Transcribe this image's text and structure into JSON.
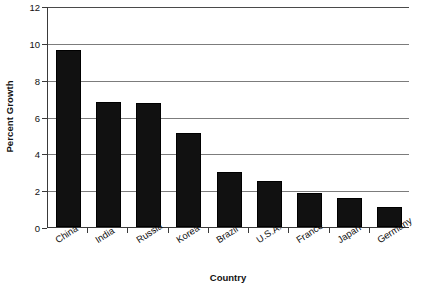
{
  "chart_data": {
    "type": "bar",
    "title": "",
    "xlabel": "Country",
    "ylabel": "Percent Growth",
    "categories": [
      "China",
      "India",
      "Russia",
      "Korea",
      "Brazil",
      "U.S.A.",
      "France",
      "Japan",
      "Germany"
    ],
    "values": [
      9.6,
      6.8,
      6.75,
      5.1,
      3.0,
      2.5,
      1.85,
      1.55,
      1.1
    ],
    "ylim": [
      0,
      12
    ],
    "ytick_labels": [
      "0",
      "2",
      "4",
      "6",
      "8",
      "10",
      "12"
    ],
    "ytick_values": [
      0,
      2,
      4,
      6,
      8,
      10,
      12
    ],
    "grid": "horizontal",
    "legend": "none",
    "bar_color": "#111111",
    "gridline_color": "#7c7c7c",
    "axis_color": "#3a3a3a",
    "background_color": "#ffffff"
  }
}
